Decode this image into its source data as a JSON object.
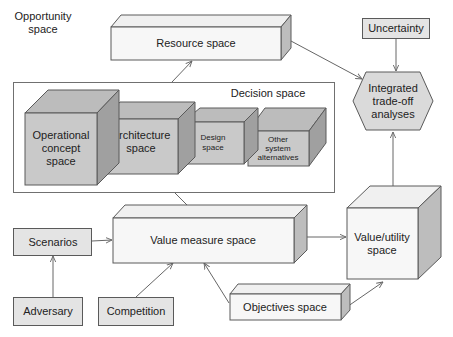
{
  "diagram": {
    "title_region": {
      "label_line1": "Opportunity",
      "label_line2": "space"
    },
    "colors": {
      "white_face": "#f7f7f7",
      "white_top": "#f0f0f0",
      "white_side": "#bdbdbd",
      "gray_front": "#c9c9c9",
      "gray_top": "#bcbcbc",
      "gray_side": "#a0a0a0",
      "flat_box": "#e4e4e4",
      "hexagon": "#dadada",
      "stroke": "#5a5a5a",
      "arrow": "#666666"
    },
    "nodes": {
      "resource_space": {
        "label": "Resource space"
      },
      "decision_space": {
        "label": "Decision space"
      },
      "operational_concept": {
        "line1": "Operational",
        "line2": "concept",
        "line3": "space"
      },
      "architecture": {
        "line1": "Architecture",
        "line2": "space"
      },
      "design": {
        "line1": "Design",
        "line2": "space"
      },
      "other_alternatives": {
        "line1": "Other",
        "line2": "system",
        "line3": "alternatives"
      },
      "uncertainty": {
        "label": "Uncertainty"
      },
      "integrated_tradeoff": {
        "line1": "Integrated",
        "line2": "trade-off",
        "line3": "analyses"
      },
      "value_measure_space": {
        "label": "Value measure space"
      },
      "scenarios": {
        "label": "Scenarios"
      },
      "adversary": {
        "label": "Adversary"
      },
      "competition": {
        "label": "Competition"
      },
      "objectives_space": {
        "label": "Objectives space"
      },
      "value_utility": {
        "line1": "Value/utility",
        "line2": "space"
      }
    },
    "edges": [
      {
        "from": "decision_space",
        "to": "resource_space"
      },
      {
        "from": "resource_space",
        "to": "integrated_tradeoff"
      },
      {
        "from": "uncertainty",
        "to": "integrated_tradeoff"
      },
      {
        "from": "value_utility",
        "to": "integrated_tradeoff"
      },
      {
        "from": "decision_space",
        "to": "value_measure_space"
      },
      {
        "from": "scenarios",
        "to": "value_measure_space"
      },
      {
        "from": "adversary",
        "to": "scenarios"
      },
      {
        "from": "competition",
        "to": "value_measure_space"
      },
      {
        "from": "objectives_space",
        "to": "value_measure_space"
      },
      {
        "from": "value_measure_space",
        "to": "value_utility"
      },
      {
        "from": "objectives_space",
        "to": "value_utility"
      }
    ]
  }
}
